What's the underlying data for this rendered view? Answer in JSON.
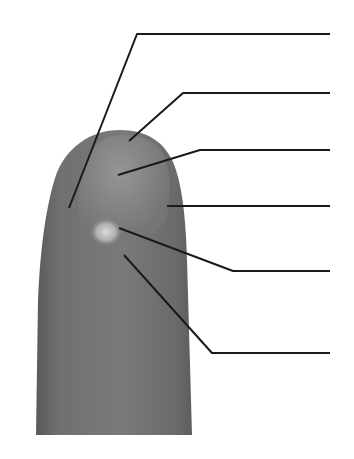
{
  "diagram": {
    "background_color": "#ffffff",
    "finger_color": "#6e6e6e",
    "line_color": "#1a1a1a",
    "leader_lines": [
      {
        "id": 1,
        "points": [
          [
            330,
            34
          ],
          [
            137,
            34
          ],
          [
            69,
            208
          ]
        ],
        "label": ""
      },
      {
        "id": 2,
        "points": [
          [
            330,
            93
          ],
          [
            183,
            93
          ],
          [
            129,
            141
          ]
        ],
        "label": ""
      },
      {
        "id": 3,
        "points": [
          [
            330,
            150
          ],
          [
            200,
            150
          ],
          [
            118,
            175
          ]
        ],
        "label": ""
      },
      {
        "id": 4,
        "points": [
          [
            330,
            206
          ],
          [
            167,
            206
          ]
        ],
        "label": ""
      },
      {
        "id": 5,
        "points": [
          [
            330,
            271
          ],
          [
            233,
            271
          ],
          [
            119,
            228
          ]
        ],
        "label": ""
      },
      {
        "id": 6,
        "points": [
          [
            330,
            353
          ],
          [
            212,
            353
          ],
          [
            124,
            255
          ]
        ],
        "label": ""
      }
    ]
  }
}
